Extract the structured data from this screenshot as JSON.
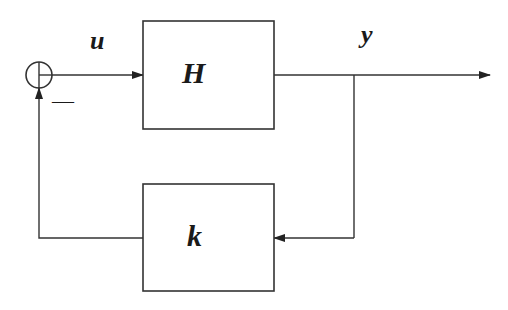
{
  "diagram": {
    "type": "feedback-block-diagram",
    "signals": {
      "input_label": "u",
      "output_label": "y"
    },
    "blocks": [
      {
        "id": "plant",
        "label": "H"
      },
      {
        "id": "feedback",
        "label": "k"
      }
    ],
    "summing_junction": {
      "feedback_sign": "—"
    },
    "colors": {
      "stroke": "#333333",
      "background": "#ffffff"
    }
  }
}
